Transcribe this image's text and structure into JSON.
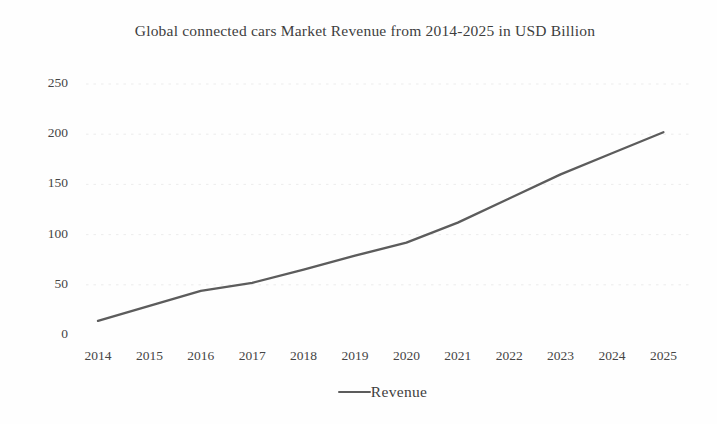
{
  "chart_data": {
    "type": "line",
    "title": "Global connected cars Market Revenue from 2014-2025 in USD Billion",
    "categories": [
      "2014",
      "2015",
      "2016",
      "2017",
      "2018",
      "2019",
      "2020",
      "2021",
      "2022",
      "2023",
      "2024",
      "2025"
    ],
    "series": [
      {
        "name": "Revenue",
        "values": [
          14,
          29,
          44,
          52,
          65,
          79,
          92,
          112,
          136,
          160,
          181,
          202
        ]
      }
    ],
    "xlabel": "",
    "ylabel": "",
    "ylim": [
      0,
      250
    ],
    "yticks": [
      0,
      50,
      100,
      150,
      200,
      250
    ],
    "grid": "faint-dashed-horizontal",
    "legend_position": "bottom-center",
    "axis_lines": "none",
    "line_color": "#5c5c5c",
    "grid_color": "#c9c9c9",
    "text_color": "#3e3e3e"
  }
}
